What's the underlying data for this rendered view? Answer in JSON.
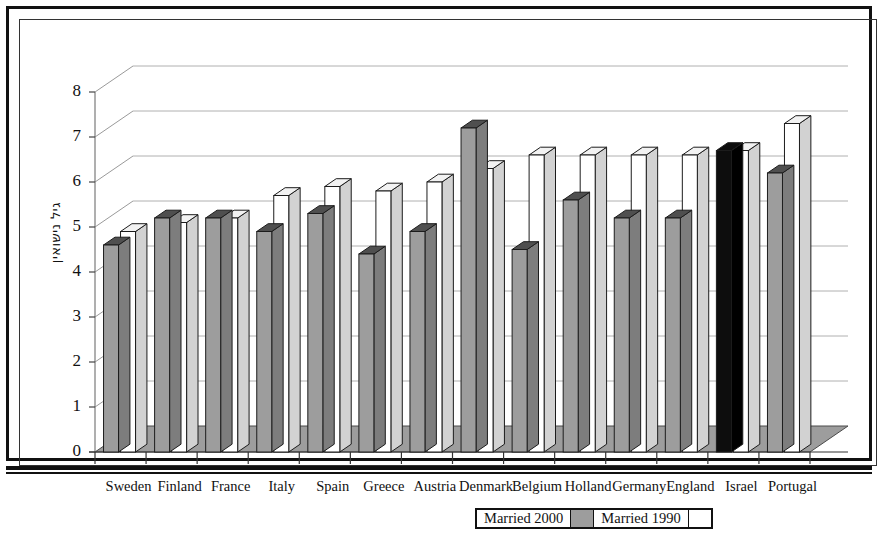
{
  "chart_data": {
    "type": "bar",
    "title": "",
    "subtitle": "",
    "xlabel": "",
    "ylabel": "גיל נישואין",
    "ylim": [
      0,
      8
    ],
    "yticks": [
      0,
      1,
      2,
      3,
      4,
      5,
      6,
      7,
      8
    ],
    "ytick_labels": [
      "0",
      "1",
      "2",
      "3",
      "4",
      "5",
      "6",
      "7",
      "8"
    ],
    "grid": true,
    "grid_axis": "y",
    "legend_position": "bottom",
    "style": "3d-column",
    "categories": [
      "Sweden",
      "Finland",
      "France",
      "Italy",
      "Spain",
      "Greece",
      "Austria",
      "Denmark",
      "Belgium",
      "Holland",
      "Germany",
      "England",
      "Israel",
      "Portugal"
    ],
    "series": [
      {
        "name": "Married 2000",
        "color": "#9d9d9d",
        "values": [
          4.6,
          5.2,
          5.2,
          4.9,
          5.3,
          4.4,
          4.9,
          7.2,
          4.5,
          5.6,
          5.2,
          5.2,
          6.7,
          6.2
        ],
        "highlight": {
          "category": "Israel",
          "color": "#0d0d0d"
        }
      },
      {
        "name": "Married 1990",
        "color": "#ffffff",
        "values": [
          4.9,
          5.1,
          5.2,
          5.7,
          5.9,
          5.8,
          6.0,
          6.3,
          6.6,
          6.6,
          6.6,
          6.6,
          6.7,
          7.3
        ]
      }
    ]
  },
  "legend": {
    "items": [
      {
        "label": "Married 2000",
        "swatch": "gray"
      },
      {
        "label": "Married 1990",
        "swatch": "white"
      }
    ]
  }
}
